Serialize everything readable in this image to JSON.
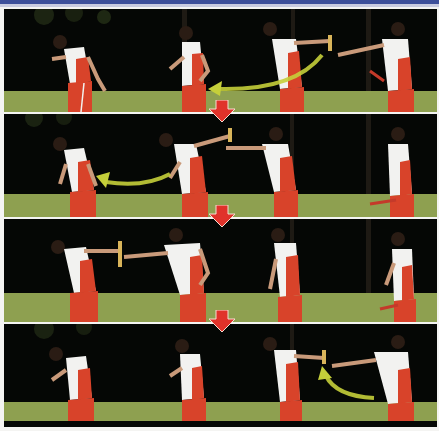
{
  "figure": {
    "panel_count": 4,
    "athletes_per_panel": 4,
    "caption": "",
    "colors": {
      "header_bar": "#3d4f9a",
      "background": "#050705",
      "grass": "#8ea050",
      "jersey_white": "#f2f2f0",
      "jersey_red": "#d8432a",
      "step_arrow": "#e0322a",
      "motion_arrow": "#c5cf3a",
      "baton": "#d9b45a"
    }
  },
  "panels": [
    {
      "index": 1,
      "motion_arrow": "right-to-left",
      "baton_holder": "athlete-4",
      "step_arrow_below": true
    },
    {
      "index": 2,
      "motion_arrow": "right-to-left",
      "baton_holder": "athlete-2",
      "step_arrow_below": true
    },
    {
      "index": 3,
      "motion_arrow": "none",
      "baton_holder": "athlete-1",
      "step_arrow_below": true
    },
    {
      "index": 4,
      "motion_arrow": "up-to-left",
      "baton_holder": "athlete-3",
      "step_arrow_below": false
    }
  ],
  "icons": {
    "step_arrow": "down-arrow-icon",
    "motion_arrow": "curved-arrow-icon"
  }
}
